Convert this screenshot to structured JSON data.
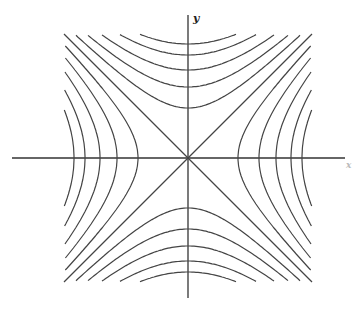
{
  "diagram": {
    "type": "hyperbolic level curves (saddle) x^2 - y^2 = c",
    "center": [
      188,
      158
    ],
    "half_extent": 124,
    "vertex_offsets": [
      50,
      71,
      88,
      103,
      114
    ],
    "x_axis_label": "x",
    "y_axis_label": "y",
    "line_color": "#444444"
  }
}
